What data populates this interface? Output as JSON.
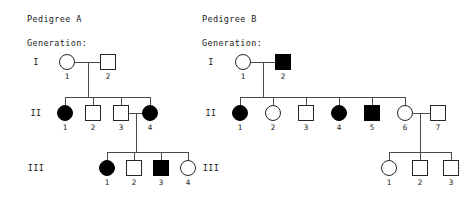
{
  "pedigrees": [
    {
      "id": "A",
      "title": "Pedigree A",
      "generation_label": "Generation:",
      "generations": [
        {
          "roman": "I",
          "members": [
            {
              "number": "1",
              "sex": "female",
              "affected": false
            },
            {
              "number": "2",
              "sex": "male",
              "affected": false
            }
          ]
        },
        {
          "roman": "II",
          "members": [
            {
              "number": "1",
              "sex": "female",
              "affected": true
            },
            {
              "number": "2",
              "sex": "male",
              "affected": false
            },
            {
              "number": "3",
              "sex": "male",
              "affected": false
            },
            {
              "number": "4",
              "sex": "female",
              "affected": true
            }
          ]
        },
        {
          "roman": "III",
          "members": [
            {
              "number": "1",
              "sex": "female",
              "affected": true
            },
            {
              "number": "2",
              "sex": "male",
              "affected": false
            },
            {
              "number": "3",
              "sex": "male",
              "affected": true
            },
            {
              "number": "4",
              "sex": "female",
              "affected": false
            }
          ]
        }
      ]
    },
    {
      "id": "B",
      "title": "Pedigree B",
      "generation_label": "Generation:",
      "generations": [
        {
          "roman": "I",
          "members": [
            {
              "number": "1",
              "sex": "female",
              "affected": false
            },
            {
              "number": "2",
              "sex": "male",
              "affected": true
            }
          ]
        },
        {
          "roman": "II",
          "members": [
            {
              "number": "1",
              "sex": "female",
              "affected": true
            },
            {
              "number": "2",
              "sex": "female",
              "affected": false
            },
            {
              "number": "3",
              "sex": "male",
              "affected": false
            },
            {
              "number": "4",
              "sex": "female",
              "affected": true
            },
            {
              "number": "5",
              "sex": "male",
              "affected": true
            },
            {
              "number": "6",
              "sex": "female",
              "affected": false
            },
            {
              "number": "7",
              "sex": "male",
              "affected": false
            }
          ]
        },
        {
          "roman": "III",
          "members": [
            {
              "number": "1",
              "sex": "female",
              "affected": false
            },
            {
              "number": "2",
              "sex": "male",
              "affected": false
            },
            {
              "number": "3",
              "sex": "male",
              "affected": false
            }
          ]
        }
      ]
    }
  ],
  "colors": {
    "affected_fill": "#000000",
    "unaffected_fill": "#ffffff",
    "symbol_stroke": "#262626",
    "connector_stroke": "#4a4a4a",
    "text": "#1a1a1a",
    "background": "#ffffff"
  },
  "layout": {
    "pedigree_a": {
      "title_pos": {
        "x": 27,
        "y": 14
      },
      "generation_label_pos": {
        "x": 27,
        "y": 38
      },
      "roman_x": 36,
      "rows_y": [
        62,
        113,
        168
      ],
      "symbol_size": 15,
      "gen1_x": [
        67,
        108
      ],
      "gen2_x": [
        65,
        93,
        121,
        150
      ],
      "gen3_x": [
        107,
        134,
        161,
        188
      ]
    },
    "pedigree_b": {
      "title_pos": {
        "x": 202,
        "y": 14
      },
      "generation_label_pos": {
        "x": 202,
        "y": 38
      },
      "roman_x": 211,
      "rows_y": [
        62,
        113,
        168
      ],
      "symbol_size": 15,
      "gen1_x": [
        243,
        283
      ],
      "gen2_x": [
        240,
        273,
        306,
        339,
        372,
        405,
        438
      ],
      "gen3_x": [
        389,
        420,
        451
      ]
    }
  }
}
